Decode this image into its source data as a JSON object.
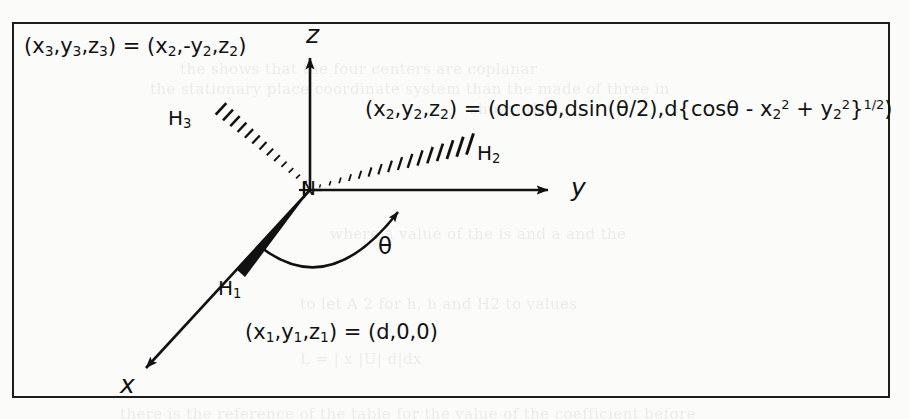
{
  "figure": {
    "caption_text": "",
    "border_color": "#1d1d1d",
    "ink_color": "#111111",
    "paper_color": "#fbfbfa"
  },
  "axes": {
    "z_label": "z",
    "y_label": "y",
    "x_label": "x"
  },
  "center_atom": {
    "label": "N"
  },
  "atoms": [
    {
      "label_html": "H<sub>3</sub>",
      "plain": "H3",
      "bond_style": "hashed-wedge"
    },
    {
      "label_html": "H<sub>2</sub>",
      "plain": "H2",
      "bond_style": "hashed-wedge"
    },
    {
      "label_html": "H<sub>1</sub>",
      "plain": "H1",
      "bond_style": "solid-wedge"
    }
  ],
  "angle": {
    "symbol": "θ"
  },
  "coordinate_labels": {
    "h3": "(x<sub>3</sub>,y<sub>3</sub>,z<sub>3</sub>) = (x<sub>2</sub>,-y<sub>2</sub>,z<sub>2</sub>)",
    "h3_plain": "(x3,y3,z3) = (x2,-y2,z2)",
    "h2": "(x<sub>2</sub>,y<sub>2</sub>,z<sub>2</sub>) = (dcosθ,dsin(θ/2),d{cosθ - x<sub>2</sub><sup>2</sup> + y<sub>2</sub><sup>2</sup>}<sup>1/2</sup>)",
    "h2_plain": "(x2,y2,z2) = (dcosθ,dsin(θ/2),d{cosθ - x2^2 + y2^2}^1/2)",
    "h1": "(x<sub>1</sub>,y<sub>1</sub>,z<sub>1</sub>) = (d,0,0)",
    "h1_plain": "(x1,y1,z1) = (d,0,0)"
  },
  "bleed_through": {
    "note": "faint illegible show-through text from reverse page",
    "lines": [
      {
        "text": "the shows that the four centers are coplanar",
        "x": 180,
        "y": 60
      },
      {
        "text": "the stationary place coordinate system than the made of three in",
        "x": 150,
        "y": 80
      },
      {
        "text": "shown that",
        "x": 470,
        "y": 100
      },
      {
        "text": "where a value of    the    is and    a and    the",
        "x": 330,
        "y": 225
      },
      {
        "text": "to let     A    2 for    h,    h and H2 to values",
        "x": 300,
        "y": 295
      },
      {
        "text": "L   = | x  |U|   d|dx",
        "x": 300,
        "y": 350
      },
      {
        "text": "there is the reference of the table for the value of the coefficient before",
        "x": 120,
        "y": 405
      }
    ]
  }
}
